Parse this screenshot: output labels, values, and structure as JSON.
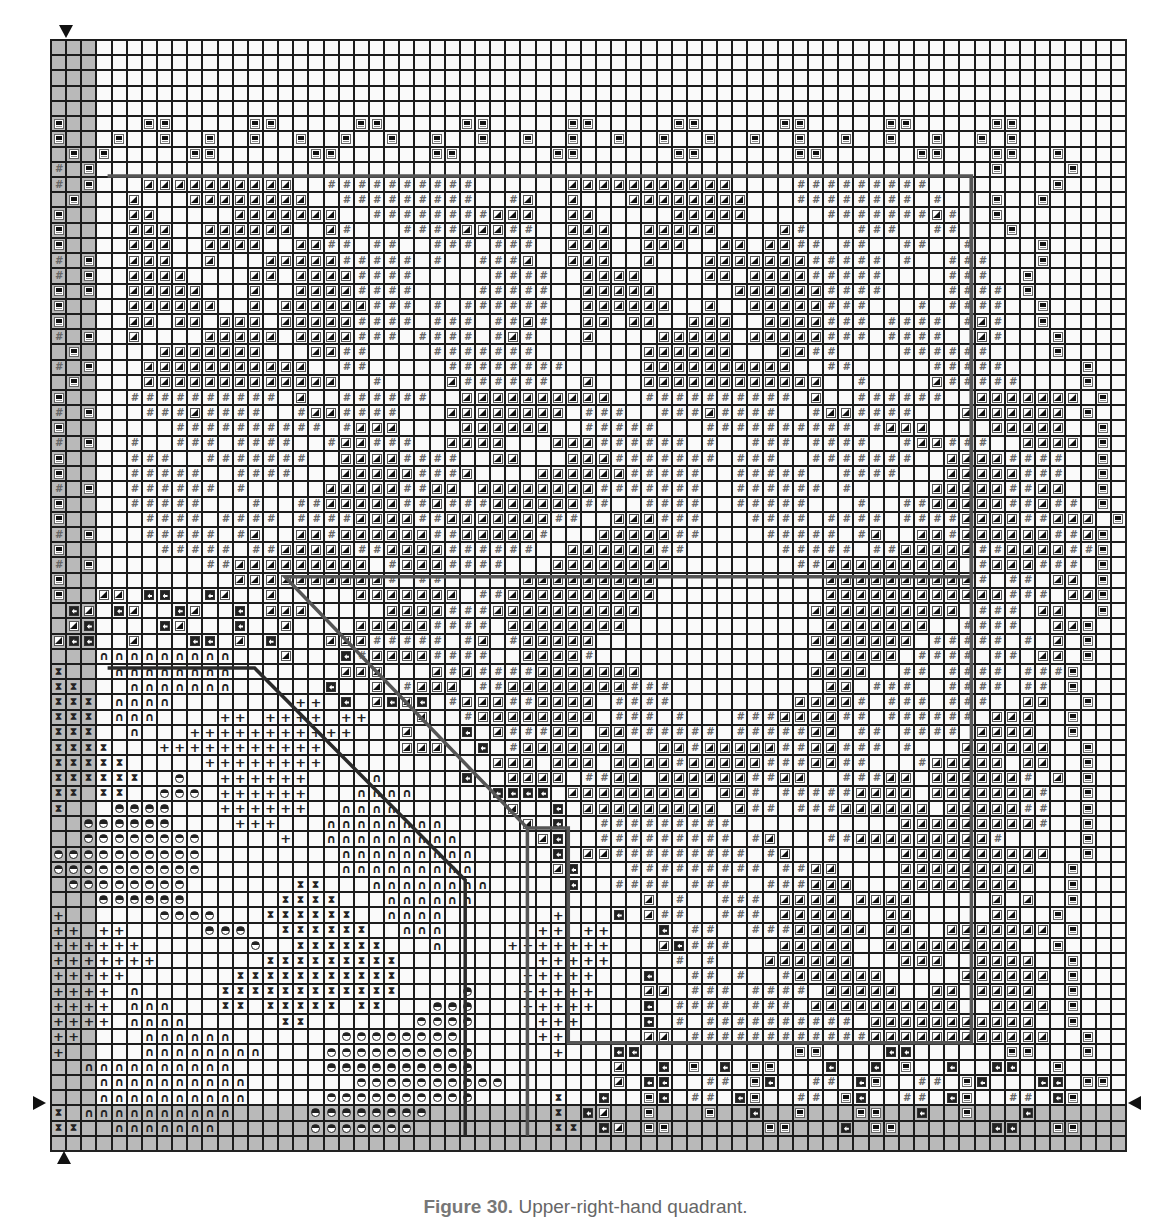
{
  "caption": {
    "label": "Figure 30.",
    "text": " Upper-right-hand quadrant."
  },
  "grid": {
    "cols": 71,
    "rows": 73,
    "shaded_cols": [
      0,
      1,
      2
    ],
    "shaded_rows": [
      70,
      71,
      72
    ],
    "legend_symbols": {
      ".": "empty",
      "T": "filled-triangle",
      "#": "hash",
      "B": "bar-box",
      "C": "arrow-box",
      "N": "arch",
      "+": "plus",
      "X": "hourglass",
      "H": "half-circle"
    },
    "cells": [
      ".......................................................................",
      ".......................................................................",
      ".......................................................................",
      ".......................................................................",
      ".......................................................................",
      "B.....BB.....BB.....BB.....BB.....BB.....BB.....BB.....BB.....BB......",
      "B...B..B..B..B..B..B..B..B..B..B..B..B..B..B..B..B..B..B..B..B.B......",
      ".B.B.....BB......BB......BB......BB......BB......BB......BB...BB..B....",
      "#.B...........................................................B....B...",
      "#.B...TTTTTTTTTT..##########......TTTTTTTTTTT....#########........B...",
      ".B...T...TTTTTTTT..#########..#T..T...TTTTTTTT...########.#...B..B....",
      "B....TT.....TTTTTTT..########TTT..TT.....TTTTT.....#######T#..B.......",
      "B....TTT..TTTTTT..T#...####TTT##..TTT..TTTTT....T#...###..##...B......",
      "B....TTT..TTTT..TT##.##..###.###..TTT..TTT..TT.TT##.##..##..#....B....",
      "#.B..TTT..T...TTTTT#####.#..###T..TTT..T...TTTTTTT#####.#..###...B....",
      "#.B..TTTT....TT.TTTT####.....####..TTTT....TT.TTTT#####....###..B.....",
      "B.B..TTTTT...T..TTTT####....#####..TTTTT.....TTTTTT####....####.B.....",
      "B....TTTTTT..T.TTTTTT###.#.######..TTTTTT..T..TTTTT###...#.####..B....",
      "B....TT.TT.TTT.TTTTT####.###.##T#..TT.TT..TTT..TTTT###.####.#T#..B....",
      "#.B..T....TTTTT.TTTT###.####.#T#...T....TTTTT.TTTTT###.####..T#...B...",
      ".B.....TTTTTTT...TT##....#######.......TTTTTT...TT##....######....B...",
      "#.B...TTTTTTTTTTT..##.....########.....TTTTTTTTTT..##.....#####.....B.",
      ".B....TTTTTTTTTTTTT..#....T######..T...TTTTTTTTTTTT..#....T#####....B.",
      "B....##########.T..######..TTTTTTTTTT..##########.T..######..TTTTTTT.B.",
      "#.B...###T####..#TT####...TTTTTTTT.###..###T####..#TT####...TTTTTTT.B..",
      "B.......##########.#TTT....TTTTTT..#####...##########.#TTT....TTTTT..B.",
      "#.B..#..###.####..#TT###..TTTT...TTT######.#..###.####..#TT###..TTTT.B.",
      "B....###..#######..TTTT####..TT...TTT#######.###..#######..TTTT####..B.",
      "B....#####..####...TTTTT###T....TTTTTT#####..#####..####...TTTTT###..B.",
      "#.B..######.#.....TTTTT##TT.TTTTTTTT#######..######.#.....TTTTT##TT..B.",
      "B....#####...#..##TTTTT##T###TTTTTT##..####..#####...#..##TTTTT##T##.B.",
      "B.....####.####.####TTTT##TTTTTTT##..TTT###...####.####.####TTTT##TTT.B",
      "#.B...#####.#T..TT#TTTTTT##TTTTT#...TTTTT##....#####.#T..TT#TTTTTT##TB.",
      "B......#####.##TTTTT##TTTT######..TTTTTT##......#####.##TTTTT##TTTT##B.",
      "#.B.......##TTTTTTTTT.#TTT####...TTTTTTTT........##TTTTTTTTT.#TTT###.B.",
      "B...........TTTTTTTTTT#.##.....TTTTTTTTT...........TTTTTTTTTT#.##.TT.B.",
      "B..TT.CC..CT..T.....TTTTTTT.##TTTTTTTTTT...........TTTTTTTTTTTT###.TTB.",
      ".CT.CT..CT..C.TTT.....TTTT###TTTTTTTTTT...........TTTTTTTTTT.###.TT..B.",
      ".TC....CT...C..T....TTTTT####.TTTTTTTT.............TTTTTTT..####..TTB..",
      "TCC..T...CC.T.C...TTT#####.#T.#TTTTT..............TTTTTTT.#####.#.T.B..",
      "...NNNNNNNNN...T...C#TTTT####..TTTT#...............TTTTT.####.##.TT.B..",
      "X...NNNNNNNN.......TTT...T#T####TTTTTTT...........TTTT..##.####.###B...",
      "XX...NNNNNNN......C..T.#TTT.##TTTTTTTT###..........TT.###..####.##.B...",
      "XXX.NNNN........++.C.TCTC.#TTT##TTTT.####........TTTT#.###.###..TT..B..",
      "XXX.NNN....++.++++.++...T..#TTTTTTTT.###.#...###TTTT##.######.TTT..B...",
      "XXX..N...+++++++++++...T...C.T###TT.TT######.#####TT.##.####.TTTT..B...",
      "XXXX...+++++++++++.....TTT..C.#TTTTTTT..TT#TTTTT##TT###.#...TTTTTT..B..",
      "XXXXX.....++++++++...........TTT.TTT.TTTT#TTTTT###TT##...#TTTTT.TT..B..",
      "XXXXXX..H..++++++....N.....C..TTTT.##TT.TTTTTT##TT..###TT.TTTTTT#.T.B..",
      "XX.XX..HHH.++++++...NNNN.....CCCC.TTTTTTTTT.TT#.#####TTTT.TTTTTTT#..B..",
      "X...HHHH...++++++..NNNN.......T..C.TTTTTTTTT.T##.###TTTTTT.TTTTT##..B..",
      "..HHHHHH....+++...NNNNNNNN.....T.C..#########...........TTTTTTTTT#..B..",
      "..HHHHHHHH.....+..NNNNNNNNN.....TC..#########.#T...##TTTTTTTTT#.....B..",
      "HHHHHHHHHH.........NNNNNNNNN.....C.TT#########.#T.......TTTTTTTTTT..B..",
      "HHHHHHHHHH.........NNNNNNNNN.....TC...#########.##TT....TTTTTTTTT..B...",
      ".HHHHHHHH.......XX...NNNNNNNN.....C..####.###..###TTT...TTTTTTTT...B...",
      "...HHHHHH......XXXX...NNNNNN...........T.#..###.TTTT.TTTT.....T.T..B...",
      "+......HHHH...XXXXXX..NNNN.......+...C.T##..###.TTTTT..TT.....TT..B....",
      "++.++.....HHH..XXXXXX..NNN......++.++...C.##..###TTTTT.TT..TTTTTTT.B...",
      "++++++.......H..XXXXXX...N....+++++++...TC###...TTTTT..TTTTTTTTT..B....",
      "+++++++.......XXXXXXXXX.........+++++....#.#...TTTTTT...TTT..TTTT..B...",
      "+++++.......XXXXXXXXXXX........+++++...C..##.#..#TTTTTT.....TTTTTT.B...",
      "++++.N.....XXXXXXXXXXXX....H...+++++...TT.###.####.TTTTT..TT.TTTT..B...",
      "++++.NNN...XX.XXXXX.XX...HHH...+++++...C.####.###.TTTTTTTTTT..TTTT.B...",
      "++++.NNNN......XX.......HHHH....+++....C.#.##########.TTTTTTTTTTT..B...",
      "++....NNNNNN.......HHHHHHHH.....++.....TT.############TTTTTTTTTTTT..B..",
      "+.....NNNNNNNN....HHHHHHHHHH.....+...CC..........BB....CC......BB...B..",
      "..NNNNNNNNNN......HHHHHHHHHH.........T..C.B.C.BB...C..C.B..C..CC..B....",
      "...NNNNNNNNNN.......HHHHHHHHHH.......T.CC..##.BC..##.CB..##.BC...CC.BB.",
      "...NNNNNNNNNN.....HHHHHHHHHH.....X..C..BC.##.CB..##.BC..##.CB..##.CB...",
      "X.NNNNNNNNNN.....HHHHHHHH........X.CT..B...B..C..B...BB..C..B...C......",
      "XX..NNNNNNN......HHHHHHH.........XX.CT.BB......BB...C.BB......CC..BB..."
    ]
  },
  "markers": {
    "top": "down-arrow-marker",
    "bottom": "up-arrow-marker",
    "left": "right-arrow-marker",
    "right": "left-arrow-marker"
  },
  "outlines": {
    "upper_box": [
      [
        3.8,
        9
      ],
      [
        60.8,
        9
      ],
      [
        60.8,
        35.3
      ],
      [
        15.5,
        35.3
      ],
      [
        31.5,
        51.8
      ],
      [
        31.5,
        72
      ]
    ],
    "lower_box": [
      [
        3.8,
        41.3
      ],
      [
        13.5,
        41.3
      ],
      [
        27.4,
        55.2
      ],
      [
        27.4,
        72
      ]
    ],
    "right_box": [
      [
        31.5,
        51.8
      ],
      [
        34.2,
        51.8
      ],
      [
        34.2,
        65.9
      ],
      [
        60.8,
        65.9
      ],
      [
        60.8,
        9
      ]
    ]
  }
}
